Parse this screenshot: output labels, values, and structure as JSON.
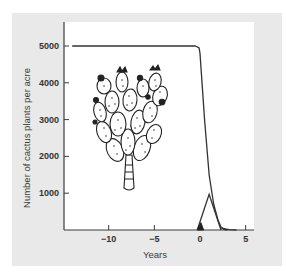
{
  "chart_data": {
    "type": "line",
    "title": "",
    "xlabel": "Years",
    "ylabel": "Number of cactus plants per acre",
    "xlim": [
      -14,
      5.8
    ],
    "ylim": [
      0,
      5600
    ],
    "x_ticks": [
      -10,
      -5,
      0,
      5
    ],
    "x_tick_labels": [
      "−10",
      "−5",
      "0",
      "5"
    ],
    "y_ticks": [
      1000,
      2000,
      3000,
      4000,
      5000
    ],
    "y_tick_labels": [
      "1000",
      "2000",
      "3000",
      "4000",
      "5000"
    ],
    "grid": false,
    "legend": null,
    "series": [
      {
        "name": "Cactus population",
        "style": "line",
        "x": [
          -14,
          -0.5,
          -0.1,
          0.0,
          0.5,
          1.0,
          1.5,
          2.0,
          2.3,
          2.6,
          3.0
        ],
        "y": [
          5000,
          5000,
          4950,
          4800,
          3000,
          1500,
          700,
          250,
          80,
          20,
          0
        ]
      },
      {
        "name": "Cactoblastis moth population (relative)",
        "style": "triangle-line",
        "x": [
          -0.3,
          1.0,
          2.3
        ],
        "y": [
          0,
          970,
          0
        ]
      },
      {
        "name": "Initial moth introduction (filled)",
        "style": "filled-triangle",
        "x": [
          -0.3,
          0.1,
          0.4
        ],
        "y": [
          0,
          200,
          0
        ]
      },
      {
        "name": "Residual low population",
        "style": "line",
        "x": [
          2.3,
          2.8,
          3.2,
          4.0
        ],
        "y": [
          60,
          30,
          10,
          0
        ]
      }
    ],
    "annotations": [
      {
        "type": "illustration",
        "label": "prickly pear cactus drawing",
        "x_range": [
          -10.8,
          -4.7
        ],
        "y_range": [
          1000,
          4400
        ]
      }
    ]
  }
}
